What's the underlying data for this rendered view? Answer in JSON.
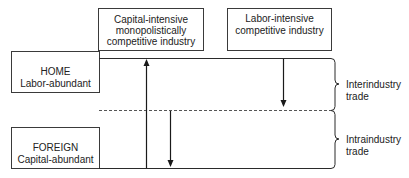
{
  "diagram": {
    "industries": {
      "capital": {
        "lines": [
          "Capital-intensive",
          "monopolistically",
          "competitive industry"
        ]
      },
      "labor": {
        "lines": [
          "Labor-intensive",
          "competitive industry"
        ]
      }
    },
    "countries": {
      "home": {
        "name": "HOME",
        "endowment": "Labor-abundant"
      },
      "foreign": {
        "name": "FOREIGN",
        "endowment": "Capital-abundant"
      }
    },
    "trade_types": {
      "interindustry": {
        "lines": [
          "Interindustry",
          "trade"
        ]
      },
      "intraindustry": {
        "lines": [
          "Intraindustry",
          "trade"
        ]
      }
    },
    "arrows": [
      {
        "name": "capital-goods-export-arrow",
        "direction": "up",
        "from": "FOREIGN",
        "to": "HOME",
        "industry": "capital"
      },
      {
        "name": "capital-goods-import-arrow",
        "direction": "down",
        "from": "divider",
        "to": "FOREIGN",
        "industry": "capital"
      },
      {
        "name": "labor-goods-export-arrow",
        "direction": "down",
        "from": "HOME",
        "to": "divider",
        "industry": "labor"
      }
    ]
  }
}
